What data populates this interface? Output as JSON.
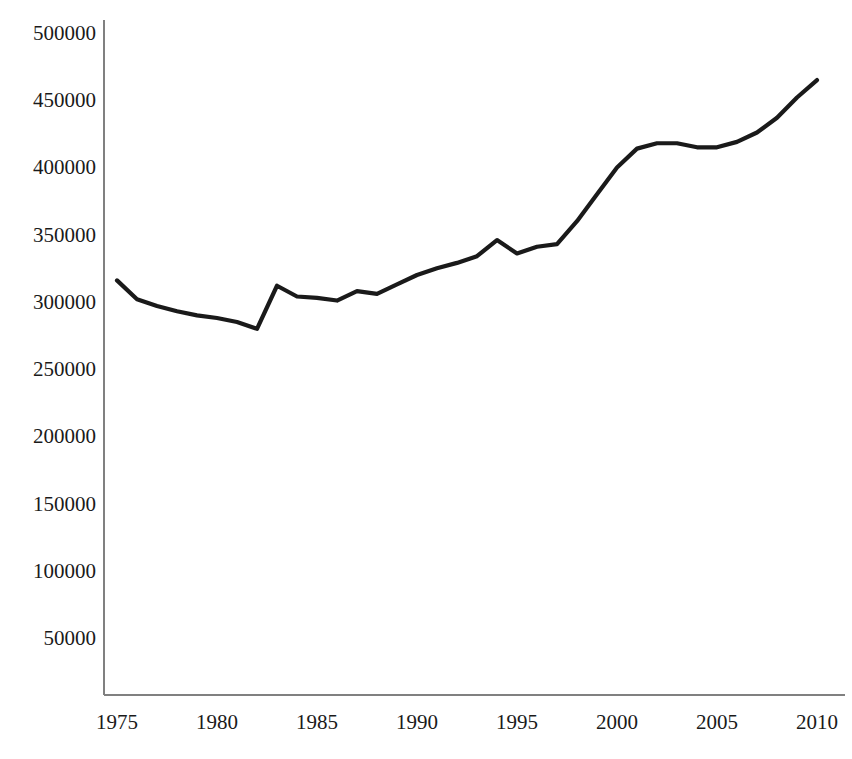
{
  "chart_data": {
    "type": "line",
    "title": "",
    "subtitle": "",
    "xlabel": "",
    "ylabel": "",
    "grid": false,
    "legend": "none",
    "line_color": "#1a1a1a",
    "axis_color": "#808080",
    "background_color": "#ffffff",
    "xlim": [
      1975,
      2010
    ],
    "ylim": [
      0,
      500000
    ],
    "xticks": [
      1975,
      1980,
      1985,
      1990,
      1995,
      2000,
      2005,
      2010
    ],
    "xtick_labels": [
      "1975",
      "1980",
      "1985",
      "1990",
      "1995",
      "2000",
      "2005",
      "2010"
    ],
    "yticks": [
      50000,
      100000,
      150000,
      200000,
      250000,
      300000,
      350000,
      400000,
      450000,
      500000
    ],
    "ytick_labels": [
      "50000",
      "100000",
      "150000",
      "200000",
      "250000",
      "300000",
      "350000",
      "400000",
      "450000",
      "500000"
    ],
    "x": [
      1975,
      1976,
      1977,
      1978,
      1979,
      1980,
      1981,
      1982,
      1983,
      1984,
      1985,
      1986,
      1987,
      1988,
      1989,
      1990,
      1991,
      1992,
      1993,
      1994,
      1995,
      1996,
      1997,
      1998,
      1999,
      2000,
      2001,
      2002,
      2003,
      2004,
      2005,
      2006,
      2007,
      2008,
      2009,
      2010
    ],
    "series": [
      {
        "name": "value",
        "values": [
          316000,
          302000,
          297000,
          293000,
          290000,
          288000,
          285000,
          280000,
          312000,
          304000,
          303000,
          301000,
          308000,
          306000,
          313000,
          320000,
          325000,
          329000,
          334000,
          346000,
          336000,
          341000,
          343000,
          360000,
          380000,
          400000,
          414000,
          418000,
          418000,
          415000,
          415000,
          419000,
          426000,
          437000,
          452000,
          465000
        ]
      }
    ]
  },
  "axes": {
    "y_axis_name": "y-axis",
    "x_axis_name": "x-axis"
  }
}
